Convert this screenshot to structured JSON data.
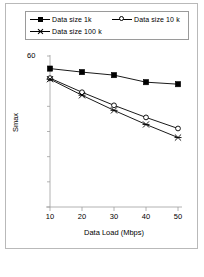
{
  "chart_data": {
    "type": "line",
    "title": "",
    "xlabel": "Data Load (Mbps)",
    "ylabel": "Smax",
    "x": [
      10,
      20,
      30,
      40,
      50
    ],
    "xtick_labels": [
      "10",
      "20",
      "30",
      "40",
      "50"
    ],
    "ytick_labels": [
      "60"
    ],
    "ytick_values": [
      60
    ],
    "xlim": [
      5,
      55
    ],
    "ylim": [
      0,
      60
    ],
    "grid": false,
    "legend_position": "top",
    "series": [
      {
        "name": "Data size 1k",
        "marker": "filled-square",
        "color": "#000000",
        "values": [
          55.0,
          53.6,
          52.4,
          49.6,
          48.8
        ]
      },
      {
        "name": "Data size 10 k",
        "marker": "open-circle",
        "color": "#000000",
        "values": [
          51.2,
          45.6,
          40.4,
          35.6,
          31.2
        ]
      },
      {
        "name": "Data size 100 k",
        "marker": "cross",
        "color": "#000000",
        "values": [
          50.8,
          44.4,
          38.4,
          32.8,
          27.6
        ]
      }
    ]
  },
  "legend": {
    "entries": [
      {
        "label": "Data size 1k",
        "marker": "filled-square"
      },
      {
        "label": "Data size 10 k",
        "marker": "open-circle"
      },
      {
        "label": "Data size 100 k",
        "marker": "cross"
      }
    ]
  },
  "axes": {
    "y_axis_label": "Smax",
    "x_axis_label": "Data Load (Mbps)",
    "y_top_tick": "60",
    "x_ticks": [
      "10",
      "20",
      "30",
      "40",
      "50"
    ]
  },
  "style": {
    "line_color": "#000000",
    "axis_color": "#a0a0a0",
    "frame_color": "#b9b9b9",
    "background": "#ffffff"
  }
}
